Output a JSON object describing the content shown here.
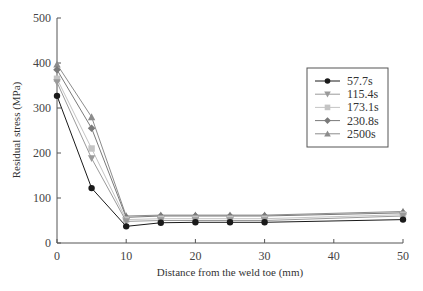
{
  "chart_data": {
    "type": "line",
    "title": "",
    "xlabel": "Distance from the weld toe (mm)",
    "ylabel": "Residual stress (MPa)",
    "xlim": [
      0,
      50
    ],
    "ylim": [
      0,
      500
    ],
    "x_ticks": [
      0,
      10,
      20,
      30,
      40,
      50
    ],
    "y_ticks": [
      0,
      100,
      200,
      300,
      400,
      500
    ],
    "grid": false,
    "legend_position": "upper right (inside)",
    "x": [
      0,
      5,
      10,
      15,
      20,
      25,
      30,
      50
    ],
    "series": [
      {
        "name": "57.7s",
        "marker": "circle",
        "color": "#1a1a1a",
        "values": [
          327,
          122,
          37,
          45,
          46,
          46,
          46,
          52
        ]
      },
      {
        "name": "115.4s",
        "marker": "triangle-down",
        "color": "#9a9a9a",
        "values": [
          357,
          188,
          48,
          50,
          50,
          50,
          50,
          60
        ]
      },
      {
        "name": "173.1s",
        "marker": "square",
        "color": "#c4c4c4",
        "values": [
          365,
          210,
          52,
          54,
          54,
          54,
          54,
          63
        ]
      },
      {
        "name": "230.8s",
        "marker": "diamond",
        "color": "#7a7a7a",
        "values": [
          385,
          255,
          57,
          60,
          60,
          60,
          60,
          67
        ]
      },
      {
        "name": "2500s",
        "marker": "triangle-up",
        "color": "#8c8c8c",
        "values": [
          397,
          280,
          60,
          62,
          62,
          62,
          62,
          70
        ]
      }
    ]
  },
  "axes": {
    "x_title": "Distance from the weld toe (mm)",
    "y_title": "Residual stress (MPa)"
  },
  "legend": {
    "items": [
      "57.7s",
      "115.4s",
      "173.1s",
      "230.8s",
      "2500s"
    ]
  }
}
